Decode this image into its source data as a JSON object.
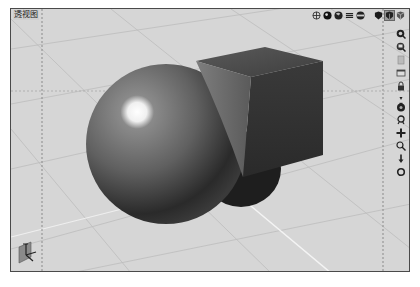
{
  "viewport": {
    "title": "透视图",
    "background": "#d6d6d6",
    "border_color": "#4a4a4a"
  },
  "top_toolbar": {
    "icons": [
      {
        "name": "wireframe-globe-icon"
      },
      {
        "name": "shaded-sphere-icon"
      },
      {
        "name": "smooth-shaded-icon"
      },
      {
        "name": "lines-icon"
      },
      {
        "name": "hidden-line-icon"
      },
      {
        "name": "flat-shield-icon"
      },
      {
        "name": "box-shaded-icon",
        "active": true
      },
      {
        "name": "box-wire-icon"
      }
    ]
  },
  "right_toolbar": {
    "icons": [
      {
        "name": "zoom-region-icon"
      },
      {
        "name": "zoom-extents-icon"
      },
      {
        "name": "document-icon"
      },
      {
        "name": "window-icon"
      },
      {
        "name": "lock-icon"
      },
      {
        "name": "dropdown-arrow-icon"
      },
      {
        "name": "camera-orbit-icon"
      },
      {
        "name": "walk-icon"
      },
      {
        "name": "pan-icon"
      },
      {
        "name": "zoom-icon"
      },
      {
        "name": "dolly-icon"
      },
      {
        "name": "roll-icon"
      }
    ]
  },
  "scene": {
    "objects": [
      "sphere",
      "cube"
    ],
    "sphere_color": "#6a6a6a",
    "cube_color": "#4a4a4a"
  }
}
